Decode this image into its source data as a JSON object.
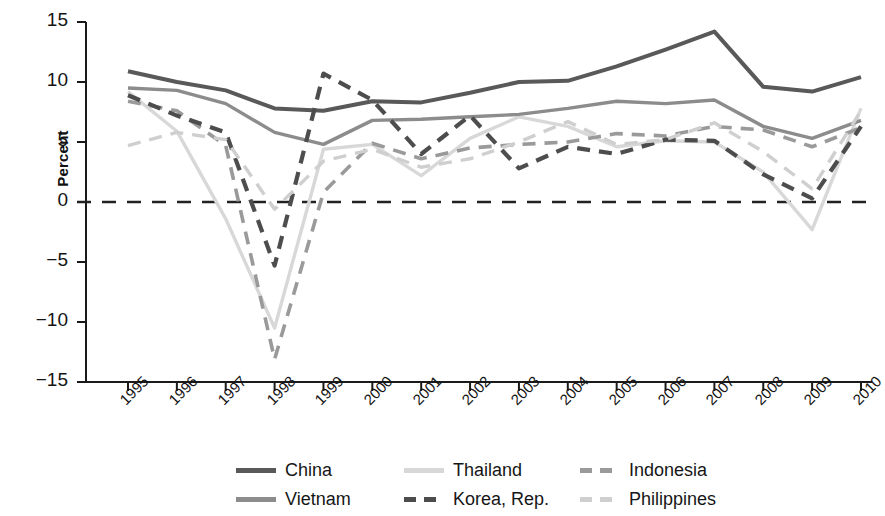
{
  "chart_data": {
    "type": "line",
    "title": "",
    "xlabel": "",
    "ylabel": "Percent",
    "categories": [
      "1995",
      "1996",
      "1997",
      "1998",
      "1999",
      "2000",
      "2001",
      "2002",
      "2003",
      "2004",
      "2005",
      "2006",
      "2007",
      "2008",
      "2009",
      "2010"
    ],
    "x": [
      1995,
      1996,
      1997,
      1998,
      1999,
      2000,
      2001,
      2002,
      2003,
      2004,
      2005,
      2006,
      2007,
      2008,
      2009,
      2010
    ],
    "ylim": [
      -15,
      15
    ],
    "yticks": [
      15,
      10,
      5,
      0,
      -5,
      -10,
      -15
    ],
    "grid": false,
    "zero_line": true,
    "legend_position": "bottom",
    "series": [
      {
        "name": "China",
        "color": "#595959",
        "style": "solid",
        "width": 4.0,
        "values": [
          10.9,
          10.0,
          9.3,
          7.8,
          7.6,
          8.4,
          8.3,
          9.1,
          10.0,
          10.1,
          11.3,
          12.7,
          14.2,
          9.6,
          9.2,
          10.4
        ]
      },
      {
        "name": "Thailand",
        "color": "#d8d8d8",
        "style": "solid",
        "width": 3.4,
        "values": [
          9.2,
          5.9,
          -1.4,
          -10.5,
          4.4,
          4.8,
          2.2,
          5.3,
          7.1,
          6.3,
          4.6,
          5.1,
          5.0,
          2.5,
          -2.3,
          7.8
        ]
      },
      {
        "name": "Indonesia",
        "color": "#9a9a9a",
        "style": "dashed",
        "width": 3.6,
        "values": [
          8.4,
          7.6,
          4.7,
          -13.1,
          0.8,
          4.9,
          3.6,
          4.5,
          4.8,
          5.0,
          5.7,
          5.5,
          6.3,
          6.0,
          4.6,
          6.2
        ]
      },
      {
        "name": "Vietnam",
        "color": "#8c8c8c",
        "style": "solid",
        "width": 3.4,
        "values": [
          9.5,
          9.3,
          8.2,
          5.8,
          4.8,
          6.8,
          6.9,
          7.1,
          7.3,
          7.8,
          8.4,
          8.2,
          8.5,
          6.3,
          5.3,
          6.8
        ]
      },
      {
        "name": "Korea, Rep.",
        "color": "#4d4d4d",
        "style": "dashed",
        "width": 4.2,
        "values": [
          8.9,
          7.2,
          5.8,
          -5.3,
          10.7,
          8.5,
          4.0,
          7.2,
          2.8,
          4.6,
          4.0,
          5.2,
          5.1,
          2.3,
          0.3,
          6.3
        ]
      },
      {
        "name": "Philippines",
        "color": "#cfcfcf",
        "style": "dashed",
        "width": 3.4,
        "values": [
          4.7,
          5.8,
          5.2,
          -0.6,
          3.4,
          4.4,
          2.9,
          3.6,
          5.0,
          6.7,
          4.8,
          5.2,
          6.6,
          4.2,
          1.1,
          7.6
        ]
      }
    ]
  },
  "axis": {
    "y_label": "Percent",
    "y_tick_labels": [
      "15",
      "10",
      "5",
      "0",
      "−5",
      "−10",
      "−15"
    ],
    "x_tick_labels": [
      "1995",
      "1996",
      "1997",
      "1998",
      "1999",
      "2000",
      "2001",
      "2002",
      "2003",
      "2004",
      "2005",
      "2006",
      "2007",
      "2008",
      "2009",
      "2010"
    ]
  },
  "legend": {
    "rows": [
      [
        {
          "label": "China",
          "color": "#595959",
          "style": "solid"
        },
        {
          "label": "Thailand",
          "color": "#d8d8d8",
          "style": "solid"
        },
        {
          "label": "Indonesia",
          "color": "#9a9a9a",
          "style": "dashed"
        }
      ],
      [
        {
          "label": "Vietnam",
          "color": "#8c8c8c",
          "style": "solid"
        },
        {
          "label": "Korea, Rep.",
          "color": "#4d4d4d",
          "style": "dashed"
        },
        {
          "label": "Philippines",
          "color": "#cfcfcf",
          "style": "dashed"
        }
      ]
    ]
  }
}
